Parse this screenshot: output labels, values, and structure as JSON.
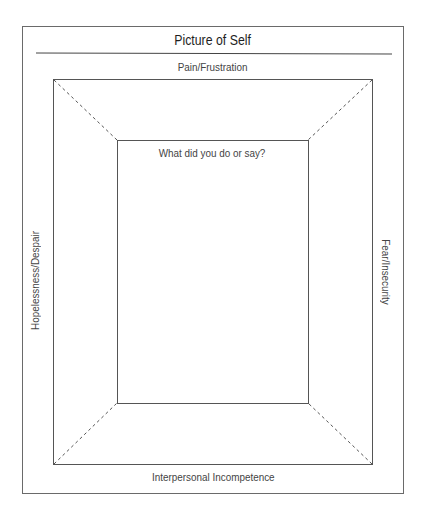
{
  "worksheet": {
    "title": "Picture of Self",
    "labels": {
      "top": "Pain/Frustration",
      "left": "Hopelessness/Despair",
      "right": "Fear/Insecurity",
      "bottom": "Interpersonal Incompetence",
      "center": "What did you do or say?"
    }
  },
  "colors": {
    "line": "#5a5a5a",
    "text": "#333333",
    "background": "#ffffff"
  }
}
